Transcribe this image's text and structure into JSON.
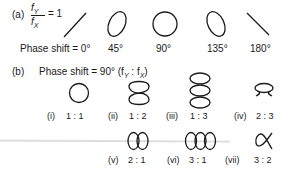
{
  "part_a": {
    "label": "(a)",
    "ratio_numerator": "f",
    "ratio_numerator_sub": "Y",
    "ratio_denominator": "f",
    "ratio_denominator_sub": "X",
    "ratio_equals": "= 1",
    "phase_label": "Phase shift = 0°",
    "figures": [
      {
        "phase": "0°",
        "shape": "diagonal-line-rising"
      },
      {
        "phase": "45°",
        "shape": "tilted-ellipse-right"
      },
      {
        "phase": "90°",
        "shape": "circle"
      },
      {
        "phase": "135°",
        "shape": "tilted-ellipse-left"
      },
      {
        "phase": "180°",
        "shape": "diagonal-line-falling"
      }
    ]
  },
  "part_b": {
    "label": "(b)",
    "title": "Phase shift = 90° (f",
    "title_sub1": "Y",
    "title_colon": " : f",
    "title_sub2": "X",
    "title_close": ")",
    "figures": [
      {
        "index": "(i)",
        "ratio": "1 : 1",
        "shape": "circle"
      },
      {
        "index": "(ii)",
        "ratio": "1 : 2",
        "shape": "two-stacked-loops"
      },
      {
        "index": "(iii)",
        "ratio": "1 : 3",
        "shape": "three-stacked-loops"
      },
      {
        "index": "(iv)",
        "ratio": "2 : 3",
        "shape": "loop-with-crossing"
      },
      {
        "index": "(v)",
        "ratio": "2 : 1",
        "shape": "two-side-loops"
      },
      {
        "index": "(vi)",
        "ratio": "3 : 1",
        "shape": "three-side-loops"
      },
      {
        "index": "(vii)",
        "ratio": "3 : 2",
        "shape": "alpha-curve"
      }
    ]
  }
}
